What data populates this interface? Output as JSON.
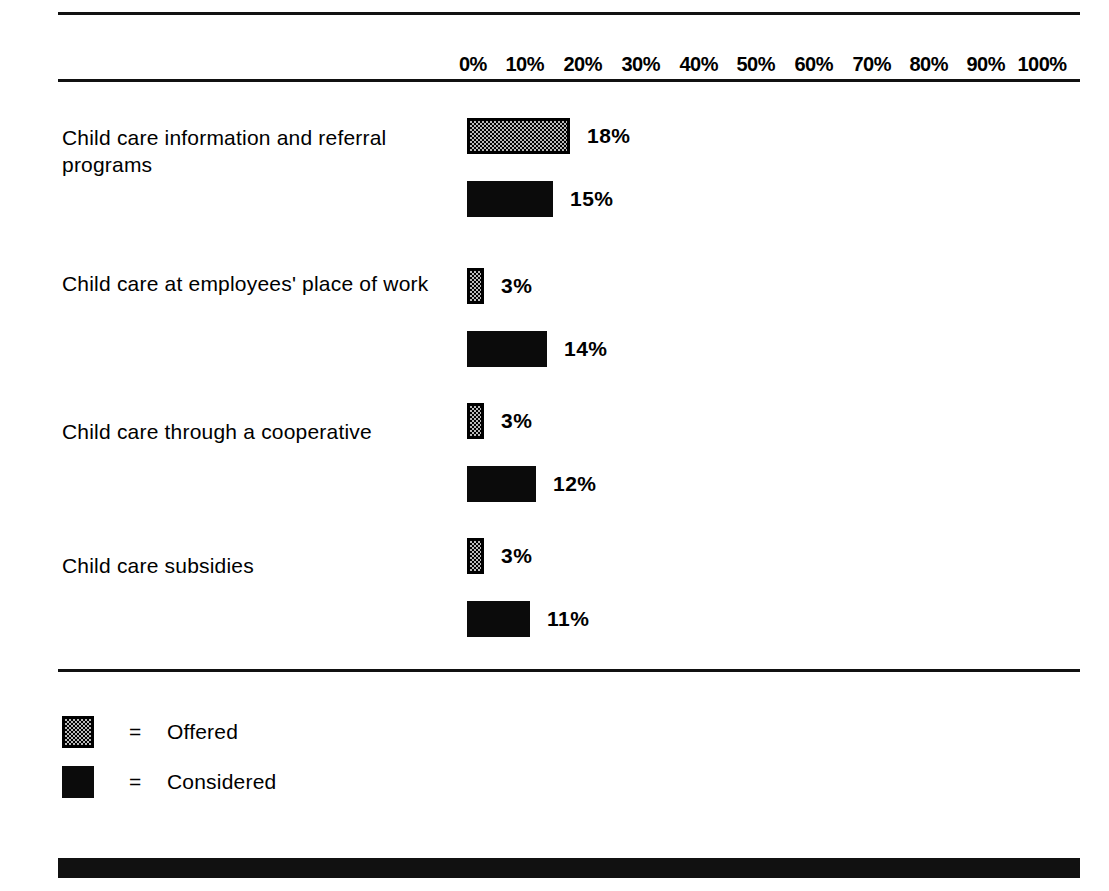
{
  "chart_data": {
    "type": "bar",
    "orientation": "horizontal",
    "title": "",
    "xlabel": "",
    "ylabel": "",
    "xlim": [
      0,
      100
    ],
    "xticks": [
      "0%",
      "10%",
      "20%",
      "30%",
      "40%",
      "50%",
      "60%",
      "70%",
      "80%",
      "90%",
      "100%"
    ],
    "grid": false,
    "legend_position": "bottom-left",
    "categories": [
      "Child care information and referral programs",
      "Child care at employees' place of work",
      "Child care through a cooperative",
      "Child care subsidies"
    ],
    "series": [
      {
        "name": "Offered",
        "values": [
          18,
          3,
          3,
          3
        ],
        "labels": [
          "18%",
          "3%",
          "3%",
          "3%"
        ],
        "fill": "checkered-gray",
        "color": "#b9b9b9",
        "border": "#000000"
      },
      {
        "name": "Considered",
        "values": [
          15,
          14,
          12,
          11
        ],
        "labels": [
          "15%",
          "14%",
          "12%",
          "11%"
        ],
        "fill": "solid",
        "color": "#0b0b0b",
        "border": "none"
      }
    ]
  },
  "axis": {
    "ticks": [
      {
        "label": "0%",
        "value": 0
      },
      {
        "label": "10%",
        "value": 10
      },
      {
        "label": "20%",
        "value": 20
      },
      {
        "label": "30%",
        "value": 30
      },
      {
        "label": "40%",
        "value": 40
      },
      {
        "label": "50%",
        "value": 50
      },
      {
        "label": "60%",
        "value": 60
      },
      {
        "label": "70%",
        "value": 70
      },
      {
        "label": "80%",
        "value": 80
      },
      {
        "label": "90%",
        "value": 90
      },
      {
        "label": "100%",
        "value": 100
      }
    ]
  },
  "rows": [
    {
      "label": "Child care information and referral programs",
      "offered": {
        "value": 18,
        "label": "18%"
      },
      "considered": {
        "value": 15,
        "label": "15%"
      }
    },
    {
      "label": "Child care at employees' place of work",
      "offered": {
        "value": 3,
        "label": "3%"
      },
      "considered": {
        "value": 14,
        "label": "14%"
      }
    },
    {
      "label": "Child care through a cooperative",
      "offered": {
        "value": 3,
        "label": "3%"
      },
      "considered": {
        "value": 12,
        "label": "12%"
      }
    },
    {
      "label": "Child care subsidies",
      "offered": {
        "value": 3,
        "label": "3%"
      },
      "considered": {
        "value": 11,
        "label": "11%"
      }
    }
  ],
  "legend": {
    "equals": "=",
    "items": [
      {
        "label": "Offered",
        "swatch": "checkered-gray"
      },
      {
        "label": "Considered",
        "swatch": "solid-black"
      }
    ]
  },
  "colors": {
    "ink": "#000000",
    "bar_considered": "#0b0b0b",
    "bar_offered_fill": "#b9b9b9",
    "page": "#ffffff"
  }
}
